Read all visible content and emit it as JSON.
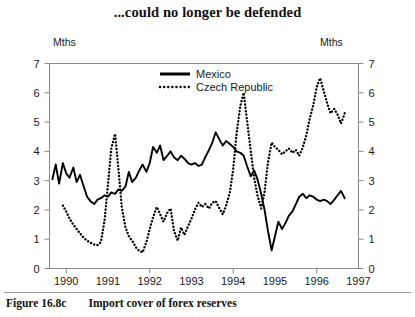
{
  "figure": {
    "title": "...could no longer be defended",
    "caption_number": "Figure 16.8c",
    "caption_text": "Import cover of forex reserves",
    "unit_label_left": "Mths",
    "unit_label_right": "Mths"
  },
  "chart_data": {
    "type": "line",
    "title": "...could no longer be defended",
    "xlabel": "",
    "ylabel": "Mths",
    "ylabel_right": "Mths",
    "xlim": [
      1989.6,
      1997.0
    ],
    "ylim": [
      0,
      7
    ],
    "yticks": [
      0,
      1,
      2,
      3,
      4,
      5,
      6,
      7
    ],
    "ytick_labels": [
      "0",
      "1",
      "2",
      "3",
      "4",
      "5",
      "6",
      "7"
    ],
    "xticks": [
      1990,
      1991,
      1992,
      1993,
      1994,
      1995,
      1996,
      1997
    ],
    "xtick_labels": [
      "1990",
      "1991",
      "1992",
      "1993",
      "1994",
      "1995",
      "1996",
      "1997"
    ],
    "grid": false,
    "legend_position": "top-center",
    "axis_frame": true,
    "dual_axis": true,
    "series": [
      {
        "name": "Mexico",
        "style": "solid",
        "color": "#000000",
        "x": [
          1989.67,
          1989.75,
          1989.83,
          1989.92,
          1990.0,
          1990.08,
          1990.17,
          1990.25,
          1990.33,
          1990.42,
          1990.5,
          1990.58,
          1990.67,
          1990.75,
          1990.83,
          1990.92,
          1991.0,
          1991.08,
          1991.17,
          1991.25,
          1991.33,
          1991.42,
          1991.5,
          1991.58,
          1991.67,
          1991.75,
          1991.83,
          1991.92,
          1992.0,
          1992.08,
          1992.17,
          1992.25,
          1992.33,
          1992.42,
          1992.5,
          1992.58,
          1992.67,
          1992.75,
          1992.83,
          1992.92,
          1993.0,
          1993.08,
          1993.17,
          1993.25,
          1993.33,
          1993.42,
          1993.5,
          1993.58,
          1993.67,
          1993.75,
          1993.83,
          1993.92,
          1994.0,
          1994.08,
          1994.17,
          1994.25,
          1994.33,
          1994.42,
          1994.5,
          1994.58,
          1994.67,
          1994.75,
          1994.83,
          1994.92,
          1995.0,
          1995.08,
          1995.17,
          1995.25,
          1995.33,
          1995.42,
          1995.5,
          1995.58,
          1995.67,
          1995.75,
          1995.83,
          1995.92,
          1996.0,
          1996.08,
          1996.17,
          1996.25,
          1996.33,
          1996.42,
          1996.5,
          1996.58,
          1996.67
        ],
        "y": [
          3.05,
          3.55,
          2.9,
          3.6,
          3.25,
          3.1,
          3.45,
          2.95,
          3.2,
          2.8,
          2.45,
          2.3,
          2.2,
          2.35,
          2.4,
          2.5,
          2.45,
          2.6,
          2.55,
          2.7,
          2.65,
          2.8,
          3.3,
          2.95,
          3.1,
          3.35,
          3.55,
          3.3,
          3.6,
          4.15,
          3.95,
          4.2,
          3.7,
          3.85,
          4.0,
          3.8,
          3.7,
          3.85,
          3.75,
          3.6,
          3.55,
          3.6,
          3.5,
          3.55,
          3.8,
          4.05,
          4.3,
          4.65,
          4.4,
          4.2,
          4.35,
          4.25,
          4.15,
          4.0,
          3.95,
          3.85,
          3.5,
          3.15,
          3.35,
          3.05,
          2.55,
          2.0,
          1.3,
          0.62,
          1.1,
          1.6,
          1.35,
          1.55,
          1.8,
          1.95,
          2.2,
          2.45,
          2.55,
          2.4,
          2.5,
          2.45,
          2.35,
          2.3,
          2.35,
          2.3,
          2.2,
          2.35,
          2.5,
          2.65,
          2.4
        ]
      },
      {
        "name": "Czech Republic",
        "style": "dotted",
        "color": "#000000",
        "x": [
          1989.92,
          1990.0,
          1990.08,
          1990.17,
          1990.25,
          1990.33,
          1990.42,
          1990.5,
          1990.58,
          1990.67,
          1990.75,
          1990.83,
          1990.92,
          1991.0,
          1991.08,
          1991.17,
          1991.25,
          1991.33,
          1991.42,
          1991.5,
          1991.58,
          1991.67,
          1991.75,
          1991.83,
          1991.92,
          1992.0,
          1992.08,
          1992.17,
          1992.25,
          1992.33,
          1992.42,
          1992.5,
          1992.58,
          1992.67,
          1992.75,
          1992.83,
          1992.92,
          1993.0,
          1993.08,
          1993.17,
          1993.25,
          1993.33,
          1993.42,
          1993.5,
          1993.58,
          1993.67,
          1993.75,
          1993.83,
          1993.92,
          1994.0,
          1994.08,
          1994.17,
          1994.25,
          1994.33,
          1994.42,
          1994.5,
          1994.58,
          1994.67,
          1994.75,
          1994.83,
          1994.92,
          1995.0,
          1995.08,
          1995.17,
          1995.25,
          1995.33,
          1995.42,
          1995.5,
          1995.58,
          1995.67,
          1995.75,
          1995.83,
          1995.92,
          1996.0,
          1996.08,
          1996.17,
          1996.25,
          1996.33,
          1996.42,
          1996.5,
          1996.58,
          1996.67
        ],
        "y": [
          2.15,
          1.95,
          1.7,
          1.5,
          1.35,
          1.2,
          1.05,
          0.95,
          0.88,
          0.82,
          0.8,
          0.9,
          1.65,
          2.85,
          4.1,
          4.6,
          3.4,
          2.1,
          1.4,
          1.1,
          0.95,
          0.72,
          0.6,
          0.55,
          0.9,
          1.35,
          1.75,
          2.1,
          1.85,
          1.6,
          1.9,
          2.05,
          1.3,
          0.95,
          1.4,
          1.15,
          1.45,
          1.7,
          2.0,
          2.25,
          2.1,
          2.2,
          2.05,
          2.25,
          2.3,
          2.05,
          1.85,
          2.15,
          2.6,
          3.4,
          4.6,
          5.55,
          6.0,
          5.05,
          4.0,
          3.1,
          2.5,
          2.05,
          2.6,
          3.6,
          4.3,
          4.15,
          4.05,
          3.9,
          4.0,
          4.1,
          3.95,
          4.05,
          3.85,
          4.15,
          4.55,
          5.1,
          5.6,
          6.2,
          6.5,
          6.05,
          5.65,
          5.3,
          5.45,
          5.25,
          4.95,
          5.3
        ]
      }
    ]
  }
}
